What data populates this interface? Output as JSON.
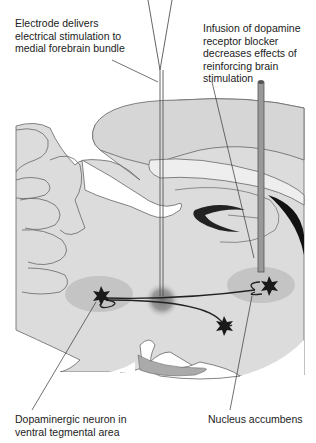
{
  "labels": {
    "electrode": "Electrode delivers\nelectrical stimulation to\nmedial forebrain bundle",
    "infusion": "Infusion of dopamine\nreceptor blocker\ndecreases effects of\nreinforcing brain\nstimulation",
    "vta": "Dopaminergic neuron in\nventral tegmental area",
    "nacc": "Nucleus accumbens"
  },
  "colors": {
    "brain_fill": "#dcdcdc",
    "region_fill": "#c4c4c4",
    "outline": "#555555",
    "neuron": "#1a1a1a",
    "stim_glow": "#8a8a8a"
  }
}
